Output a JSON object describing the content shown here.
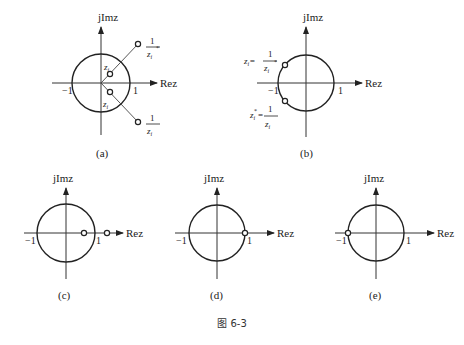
{
  "figure": {
    "caption": "图 6-3",
    "axis_labels": {
      "imag": "jImz",
      "real": "Rez"
    },
    "ticks": {
      "neg_one": "−1",
      "pos_one": "1"
    },
    "panels": [
      {
        "id": "a",
        "label": "(a)",
        "description": "Reciprocal-conjugate pair of zeros inside and outside unit circle",
        "points": [
          {
            "label": "z_i",
            "text": "z",
            "sub": "i",
            "position": "inside, upper"
          },
          {
            "label": "z_i*",
            "text": "z",
            "sub": "i",
            "sup": "*",
            "position": "inside, lower"
          },
          {
            "label": "1/z_i*",
            "num": "1",
            "den": "z",
            "den_sub": "i",
            "den_sup": "*",
            "position": "outside, upper"
          },
          {
            "label": "1/z_i",
            "num": "1",
            "den": "z",
            "den_sub": "i",
            "position": "outside, lower"
          }
        ]
      },
      {
        "id": "b",
        "label": "(b)",
        "description": "Zeros on the unit circle",
        "points": [
          {
            "label": "z_i = 1/z_i*",
            "lhs": "z",
            "lhs_sub": "i",
            "eq": "=",
            "num": "1",
            "den": "z",
            "den_sub": "i",
            "den_sup": "*"
          },
          {
            "label": "z_i* = 1/z_i",
            "lhs": "z",
            "lhs_sub": "i",
            "lhs_sup": "*",
            "eq": "=",
            "num": "1",
            "den": "z",
            "den_sub": "i"
          }
        ]
      },
      {
        "id": "c",
        "label": "(c)",
        "description": "Real zero inside and its reciprocal outside on positive real axis"
      },
      {
        "id": "d",
        "label": "(d)",
        "description": "Zero at z = 1"
      },
      {
        "id": "e",
        "label": "(e)",
        "description": "Zero at z = −1"
      }
    ]
  }
}
